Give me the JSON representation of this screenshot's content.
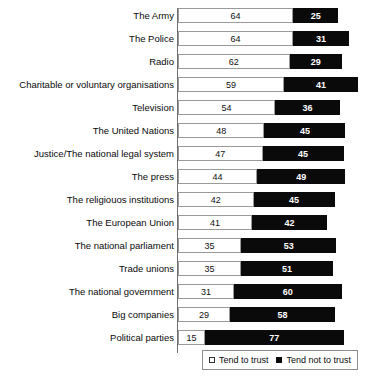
{
  "chart_data": {
    "type": "bar",
    "orientation": "horizontal",
    "stacked": true,
    "title": "",
    "xlabel": "",
    "ylabel": "",
    "grid": false,
    "xlim": [
      0,
      100
    ],
    "legend_position": "bottom-right",
    "categories": [
      "The Army",
      "The Police",
      "Radio",
      "Charitable or voluntary organisations",
      "Television",
      "The United Nations",
      "Justice/The national legal system",
      "The press",
      "The religiouos institutions",
      "The European Union",
      "The national parliament",
      "Trade unions",
      "The national government",
      "Big companies",
      "Political parties"
    ],
    "series": [
      {
        "name": "Tend to trust",
        "color": "#ffffff",
        "values": [
          64,
          64,
          62,
          59,
          54,
          48,
          47,
          44,
          42,
          41,
          35,
          35,
          31,
          29,
          15
        ]
      },
      {
        "name": "Tend not to trust",
        "color": "#0a0a0a",
        "values": [
          25,
          31,
          29,
          41,
          36,
          45,
          45,
          49,
          45,
          42,
          53,
          51,
          60,
          58,
          77
        ]
      }
    ]
  },
  "legend": {
    "items": [
      {
        "label": "Tend to trust",
        "marker": "open-square-icon"
      },
      {
        "label": "Tend not to trust",
        "marker": "filled-square-icon"
      }
    ]
  }
}
